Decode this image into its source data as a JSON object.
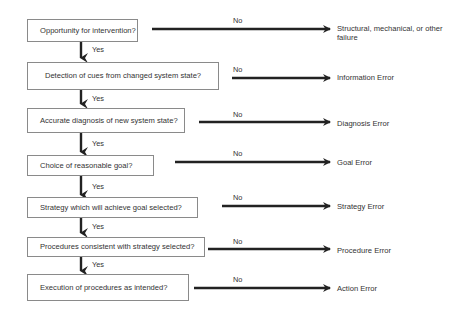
{
  "diagram": {
    "type": "flowchart",
    "nodes": [
      {
        "id": "q1",
        "label": "Opportunity for intervention?",
        "no_result": "Structural, mechanical, or other",
        "no_result_line2": "failure"
      },
      {
        "id": "q2",
        "label": "Detection of cues from changed system state?",
        "no_result": "Information Error"
      },
      {
        "id": "q3",
        "label": "Accurate diagnosis of new system state?",
        "no_result": "Diagnosis Error"
      },
      {
        "id": "q4",
        "label": "Choice of reasonable goal?",
        "no_result": "Goal Error"
      },
      {
        "id": "q5",
        "label": "Strategy which will achieve goal selected?",
        "no_result": "Strategy Error"
      },
      {
        "id": "q6",
        "label": "Procedures consistent with strategy selected?",
        "no_result": "Procedure Error"
      },
      {
        "id": "q7",
        "label": "Execution of procedures as intended?",
        "no_result": "Action Error"
      }
    ],
    "yes_label": "Yes",
    "no_label": "No",
    "colors": {
      "arrow": "#222222",
      "box_border": "#8a8a8a",
      "text": "#333333"
    }
  }
}
